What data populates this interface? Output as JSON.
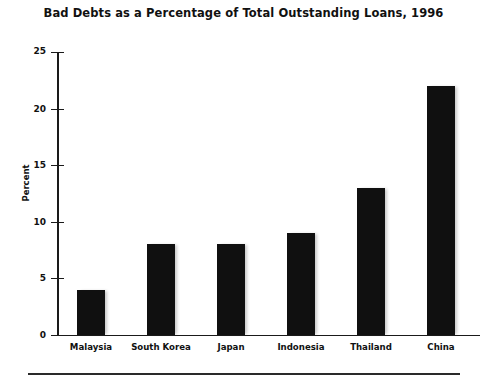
{
  "chart_data": {
    "type": "bar",
    "title": "Bad Debts as a Percentage of Total Outstanding Loans, 1996",
    "xlabel": "",
    "ylabel": "Percent",
    "categories": [
      "Malaysia",
      "South Korea",
      "Japan",
      "Indonesia",
      "Thailand",
      "China"
    ],
    "values": [
      4,
      8,
      8,
      9,
      13,
      22
    ],
    "ylim": [
      0,
      25
    ],
    "yticks": [
      0,
      5,
      10,
      15,
      20,
      25
    ],
    "ytick_labels": [
      "0",
      "5",
      "10",
      "15",
      "20",
      "25"
    ],
    "grid": false,
    "legend": null,
    "series": [
      {
        "name": "Bad debts (% of total outstanding loans)",
        "values": [
          4,
          8,
          8,
          9,
          13,
          22
        ]
      }
    ],
    "bar_color": "#101010"
  },
  "figure": {
    "title": "Bad Debts as a Percentage of Total Outstanding Loans, 1996",
    "axis_title_y": "Percent"
  }
}
